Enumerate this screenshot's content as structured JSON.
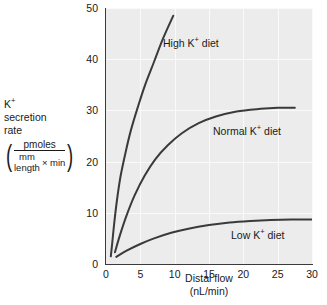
{
  "chart_data": {
    "type": "line",
    "title": "",
    "xlabel": "Distal flow",
    "xlabel_units": "(nL/min)",
    "ylabel_line1": "K",
    "ylabel_line1_sup": "+",
    "ylabel_line2": "secretion",
    "ylabel_line3": "rate",
    "ylabel_unit_numerator": "pmoles",
    "ylabel_unit_den_numerator": "mm",
    "ylabel_unit_den_denominator": "length",
    "ylabel_unit_den_factor": "× min",
    "xlim": [
      0,
      30
    ],
    "ylim": [
      0,
      50
    ],
    "xticks": [
      0,
      5,
      10,
      15,
      20,
      25,
      30
    ],
    "yticks": [
      0,
      10,
      20,
      30,
      40,
      50
    ],
    "grid": true,
    "grid_color": "#fafafa",
    "panel_color": "#ececec",
    "legend": "inline-annotations",
    "series": [
      {
        "name": "High K+ diet",
        "label_prefix": "High K",
        "label_sup": "+",
        "label_suffix": " diet",
        "color": "#3a3a3a",
        "points": [
          [
            0.7,
            1.5
          ],
          [
            0.9,
            4.0
          ],
          [
            1.2,
            8.0
          ],
          [
            1.6,
            12.5
          ],
          [
            2.1,
            17.0
          ],
          [
            2.8,
            21.5
          ],
          [
            3.6,
            26.0
          ],
          [
            4.6,
            30.5
          ],
          [
            5.7,
            35.0
          ],
          [
            7.0,
            39.5
          ],
          [
            8.3,
            44.0
          ],
          [
            9.8,
            48.5
          ]
        ]
      },
      {
        "name": "Normal K+ diet",
        "label_prefix": "Normal K",
        "label_sup": "+",
        "label_suffix": " diet",
        "color": "#3a3a3a",
        "points": [
          [
            1.3,
            2.3
          ],
          [
            2.0,
            5.5
          ],
          [
            3.0,
            9.5
          ],
          [
            4.2,
            13.5
          ],
          [
            5.6,
            17.2
          ],
          [
            7.2,
            20.5
          ],
          [
            9.0,
            23.2
          ],
          [
            11.0,
            25.5
          ],
          [
            13.5,
            27.5
          ],
          [
            16.0,
            28.8
          ],
          [
            19.0,
            29.8
          ],
          [
            22.5,
            30.3
          ],
          [
            25.0,
            30.5
          ],
          [
            27.5,
            30.5
          ]
        ]
      },
      {
        "name": "Low K+ diet",
        "label_prefix": "Low K",
        "label_sup": "+",
        "label_suffix": " diet",
        "color": "#3a3a3a",
        "points": [
          [
            1.5,
            1.4
          ],
          [
            3.0,
            2.6
          ],
          [
            5.0,
            3.9
          ],
          [
            7.0,
            5.0
          ],
          [
            9.5,
            6.1
          ],
          [
            12.0,
            6.9
          ],
          [
            15.0,
            7.6
          ],
          [
            18.0,
            8.1
          ],
          [
            21.0,
            8.4
          ],
          [
            24.0,
            8.6
          ],
          [
            27.0,
            8.7
          ],
          [
            30.0,
            8.7
          ]
        ]
      }
    ],
    "annotations": [
      {
        "series": "High K+ diet",
        "x_px": 163,
        "y_px": 36
      },
      {
        "series": "Normal K+ diet",
        "x_px": 213,
        "y_px": 124
      },
      {
        "series": "Low K+ diet",
        "x_px": 231,
        "y_px": 228
      }
    ]
  }
}
